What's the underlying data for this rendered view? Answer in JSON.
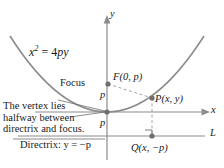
{
  "figure": {
    "background_color": "#ffffff",
    "curve_color": "#8c8c8c",
    "axis_color": "#8c8c8c",
    "text_color": "#1a1a1a"
  },
  "axes": {
    "y_label": "y",
    "x_label": "x",
    "origin": {
      "x": 107,
      "y": 112
    }
  },
  "curve": {
    "equation_label_parts": {
      "variable": "x",
      "exponent": "2",
      "equals": " = 4",
      "rhs": "py"
    },
    "equation_text": "x2 = 4py"
  },
  "points": {
    "focus": {
      "caption": "Focus",
      "label": "F(0, p)",
      "coords": {
        "x": 108,
        "y": 84
      }
    },
    "point_p": {
      "label": "P(x, y)",
      "coords": {
        "x": 152,
        "y": 98
      }
    },
    "point_q": {
      "label": "Q(x, −p)",
      "coords": {
        "x": 152,
        "y": 136
      }
    },
    "vertex": {
      "coords": {
        "x": 107,
        "y": 112
      }
    }
  },
  "distances": {
    "p_upper": "p",
    "p_lower": "p"
  },
  "annotations": {
    "vertex_note_line1": "The vertex lies",
    "vertex_note_line2": "halfway between",
    "vertex_note_line3": "directrix and focus.",
    "directrix_caption": "Directrix: y = −p",
    "directrix_line_label": "L"
  }
}
